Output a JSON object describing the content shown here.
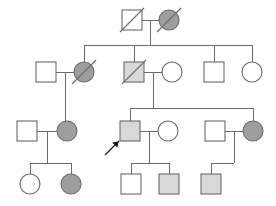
{
  "diagram": {
    "kind": "pedigree-chart",
    "title": "",
    "canvas": {
      "width": 276,
      "height": 206
    },
    "colors": {
      "line": "#6b6b6b",
      "outline": "#6b6b6b",
      "unaffected_fill": "#ffffff",
      "affected_fill": "#9e9e9e",
      "carrier_fill": "#d8d8d8",
      "arrow": "#1a1a1a",
      "background": "#ffffff"
    },
    "legend_semantics": {
      "square": "male",
      "circle": "female",
      "filled": "affected",
      "light_shaded": "partially affected / carrier",
      "empty": "unaffected",
      "diagonal_slash": "deceased",
      "arrow": "proband"
    },
    "generations": [
      {
        "id": "I",
        "individuals": [
          {
            "id": "I-1",
            "sex": "male",
            "shape": "square",
            "fill": "unaffected",
            "deceased": true,
            "proband": false,
            "cx": 132,
            "cy": 20
          },
          {
            "id": "I-2",
            "sex": "female",
            "shape": "circle",
            "fill": "affected",
            "deceased": true,
            "proband": false,
            "cx": 169,
            "cy": 20
          }
        ]
      },
      {
        "id": "II",
        "individuals": [
          {
            "id": "II-1",
            "sex": "male",
            "shape": "square",
            "fill": "unaffected",
            "deceased": false,
            "proband": false,
            "cx": 46,
            "cy": 72
          },
          {
            "id": "II-2",
            "sex": "female",
            "shape": "circle",
            "fill": "affected",
            "deceased": true,
            "proband": false,
            "cx": 84,
            "cy": 72
          },
          {
            "id": "II-3",
            "sex": "male",
            "shape": "square",
            "fill": "carrier",
            "deceased": true,
            "proband": false,
            "cx": 134,
            "cy": 72
          },
          {
            "id": "II-4",
            "sex": "female",
            "shape": "circle",
            "fill": "unaffected",
            "deceased": false,
            "proband": false,
            "cx": 172,
            "cy": 72
          },
          {
            "id": "II-5",
            "sex": "male",
            "shape": "square",
            "fill": "unaffected",
            "deceased": false,
            "proband": false,
            "cx": 214,
            "cy": 72
          },
          {
            "id": "II-6",
            "sex": "female",
            "shape": "circle",
            "fill": "unaffected",
            "deceased": false,
            "proband": false,
            "cx": 252,
            "cy": 72
          }
        ]
      },
      {
        "id": "III",
        "individuals": [
          {
            "id": "III-1",
            "sex": "male",
            "shape": "square",
            "fill": "unaffected",
            "deceased": false,
            "proband": false,
            "cx": 27,
            "cy": 131
          },
          {
            "id": "III-2",
            "sex": "female",
            "shape": "circle",
            "fill": "affected",
            "deceased": false,
            "proband": false,
            "cx": 67,
            "cy": 131
          },
          {
            "id": "III-3",
            "sex": "male",
            "shape": "square",
            "fill": "carrier",
            "deceased": false,
            "proband": true,
            "cx": 130,
            "cy": 131
          },
          {
            "id": "III-4",
            "sex": "female",
            "shape": "circle",
            "fill": "unaffected",
            "deceased": false,
            "proband": false,
            "cx": 168,
            "cy": 131
          },
          {
            "id": "III-5",
            "sex": "male",
            "shape": "square",
            "fill": "unaffected",
            "deceased": false,
            "proband": false,
            "cx": 215,
            "cy": 131
          },
          {
            "id": "III-6",
            "sex": "female",
            "shape": "circle",
            "fill": "affected",
            "deceased": false,
            "proband": false,
            "cx": 253,
            "cy": 131
          }
        ]
      },
      {
        "id": "IV",
        "individuals": [
          {
            "id": "IV-1",
            "sex": "female",
            "shape": "circle",
            "fill": "unaffected",
            "deceased": false,
            "proband": false,
            "cx": 30,
            "cy": 184
          },
          {
            "id": "IV-2",
            "sex": "female",
            "shape": "circle",
            "fill": "affected",
            "deceased": false,
            "proband": false,
            "cx": 71,
            "cy": 184
          },
          {
            "id": "IV-3",
            "sex": "male",
            "shape": "square",
            "fill": "unaffected",
            "deceased": false,
            "proband": false,
            "cx": 131,
            "cy": 184
          },
          {
            "id": "IV-4",
            "sex": "male",
            "shape": "square",
            "fill": "carrier",
            "deceased": false,
            "proband": false,
            "cx": 169,
            "cy": 184
          },
          {
            "id": "IV-5",
            "sex": "male",
            "shape": "square",
            "fill": "carrier",
            "deceased": false,
            "proband": false,
            "cx": 211,
            "cy": 184
          }
        ]
      }
    ],
    "matings": [
      {
        "id": "mating-I",
        "partners": [
          "I-1",
          "I-2"
        ],
        "y": 20
      },
      {
        "id": "mating-II-1",
        "partners": [
          "II-1",
          "II-2"
        ],
        "y": 72
      },
      {
        "id": "mating-II-3",
        "partners": [
          "II-3",
          "II-4"
        ],
        "y": 72
      },
      {
        "id": "mating-III-1",
        "partners": [
          "III-1",
          "III-2"
        ],
        "y": 131
      },
      {
        "id": "mating-III-3",
        "partners": [
          "III-3",
          "III-4"
        ],
        "y": 131
      },
      {
        "id": "mating-III-5",
        "partners": [
          "III-5",
          "III-6"
        ],
        "y": 131
      }
    ],
    "sibships": [
      {
        "id": "sibship-II",
        "parents": "mating-I",
        "children": [
          "II-2",
          "II-3",
          "II-5",
          "II-6"
        ],
        "bar_y": 45
      },
      {
        "id": "sibship-III-from-II-1",
        "parents": "mating-II-1",
        "children": [
          "III-2"
        ],
        "bar_y": 0
      },
      {
        "id": "sibship-III-from-II-3",
        "parents": "mating-II-3",
        "children": [
          "III-3",
          "III-6"
        ],
        "bar_y": 108
      },
      {
        "id": "sibship-IV-from-III-1",
        "parents": "mating-III-1",
        "children": [
          "IV-1",
          "IV-2"
        ],
        "bar_y": 163
      },
      {
        "id": "sibship-IV-from-III-3",
        "parents": "mating-III-3",
        "children": [
          "IV-3",
          "IV-4"
        ],
        "bar_y": 163
      },
      {
        "id": "sibship-IV-from-III-5",
        "parents": "mating-III-5",
        "children": [
          "IV-5"
        ],
        "bar_y": 163
      }
    ],
    "proband_marker": {
      "id": "proband-arrow",
      "target": "III-3",
      "from_x": 105,
      "from_y": 155,
      "to_x": 119,
      "to_y": 141
    }
  }
}
